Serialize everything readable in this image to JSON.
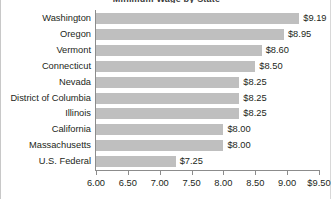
{
  "chart_data": {
    "type": "bar",
    "orientation": "horizontal",
    "title": "Minimum Wage by State",
    "xlabel": "",
    "ylabel": "",
    "xlim": [
      6.0,
      9.5
    ],
    "grid": false,
    "legend": null,
    "legend_position": "none",
    "bar_color": "#bfbfbf",
    "axis_color": "#8c8c8c",
    "text_color": "#231f20",
    "categories": [
      "Washington",
      "Oregon",
      "Vermont",
      "Connecticut",
      "Nevada",
      "District of Columbia",
      "Illinois",
      "California",
      "Massachusetts",
      "U.S. Federal"
    ],
    "values": [
      9.19,
      8.95,
      8.6,
      8.5,
      8.25,
      8.25,
      8.25,
      8.0,
      8.0,
      7.25
    ],
    "data_labels": [
      "$9.19",
      "$8.95",
      "$8.60",
      "$8.50",
      "$8.25",
      "$8.25",
      "$8.25",
      "$8.00",
      "$8.00",
      "$7.25"
    ],
    "xticks": [
      6.0,
      6.5,
      7.0,
      7.5,
      8.0,
      8.5,
      9.0,
      9.5
    ],
    "xtick_labels": [
      "6.00",
      "6.50",
      "7.00",
      "7.50",
      "8.00",
      "8.50",
      "9.00",
      "$9.50"
    ]
  }
}
